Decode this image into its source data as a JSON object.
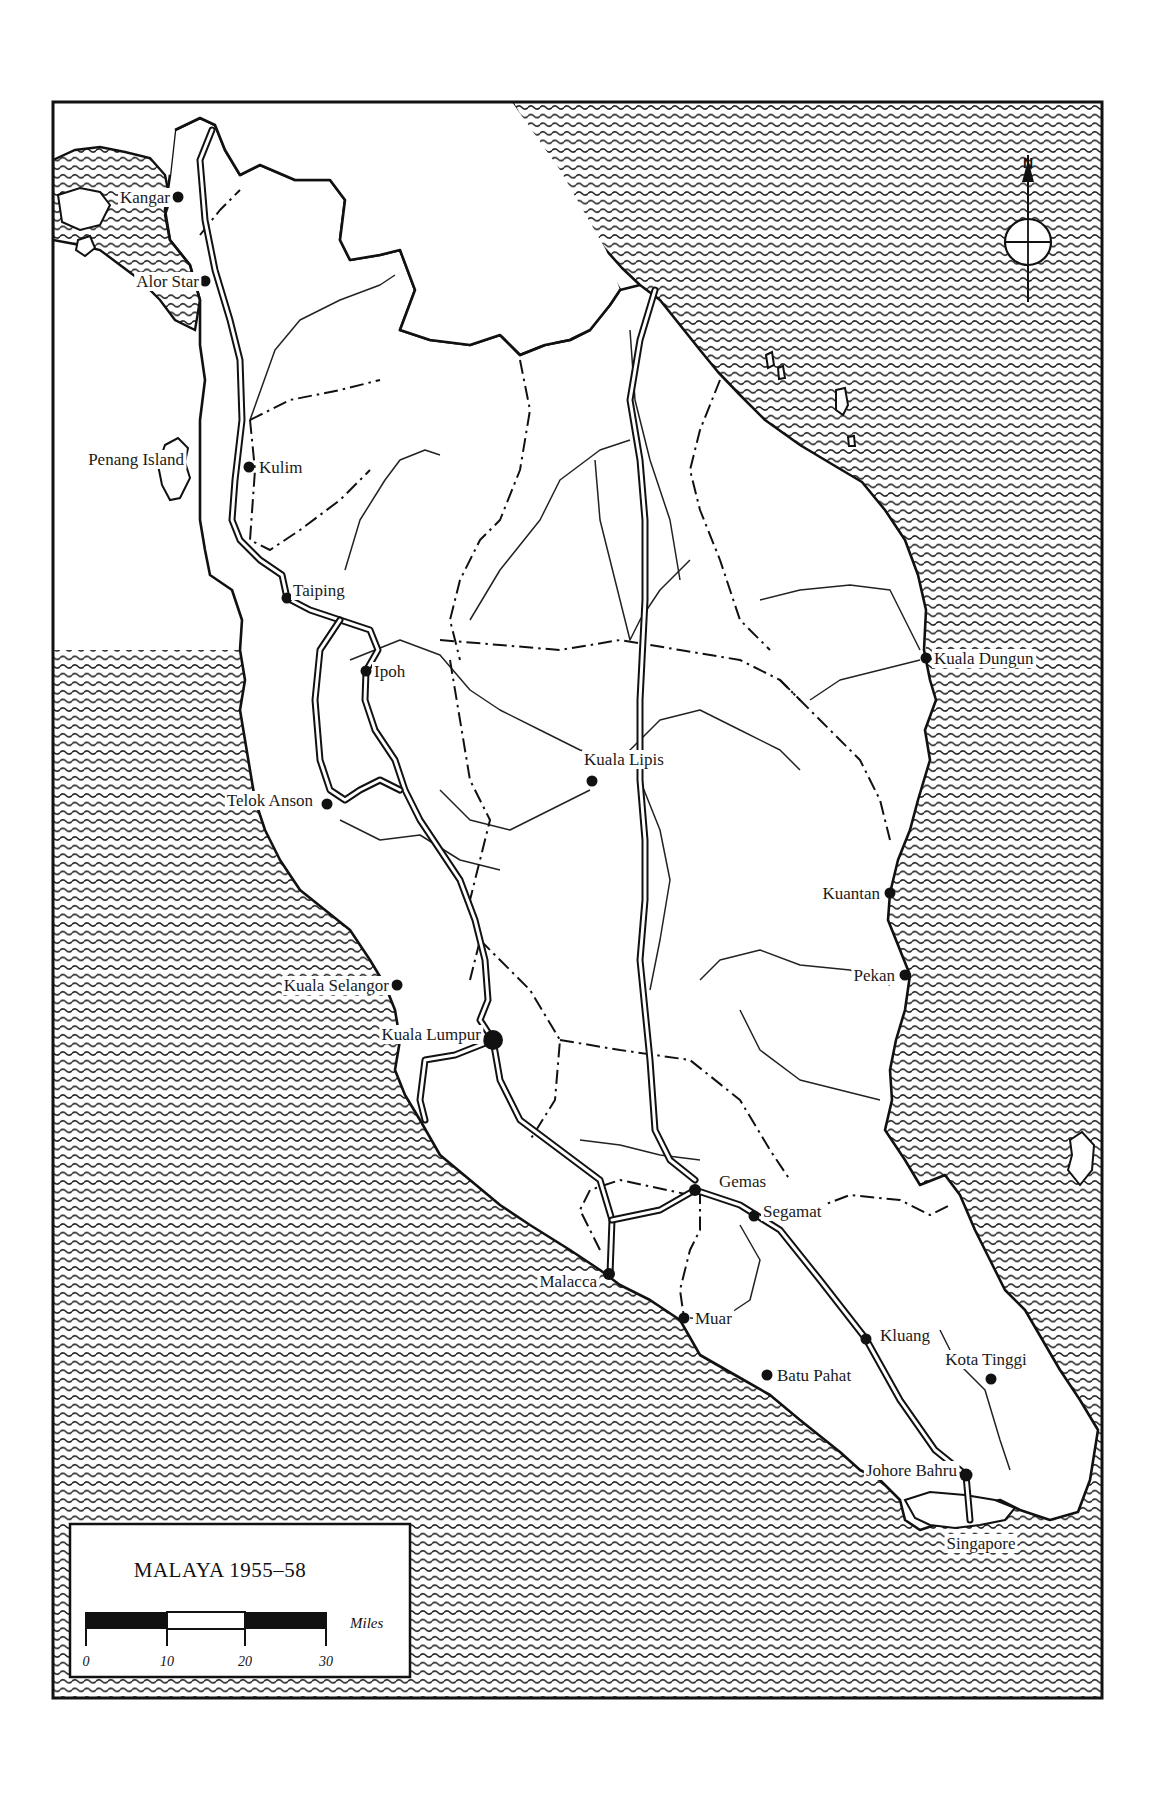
{
  "map": {
    "title": "MALAYA 1955–58",
    "frame": {
      "x": 53,
      "y": 102,
      "width": 1049,
      "height": 1596
    },
    "colors": {
      "ink": "#111111",
      "paper": "#ffffff",
      "sea_hatch": "#222222"
    },
    "north_arrow": {
      "label": "N",
      "x": 1028,
      "y": 238
    },
    "scale_bar": {
      "unit": "Miles",
      "ticks": [
        "0",
        "10",
        "20",
        "30"
      ],
      "segments": [
        "black",
        "white",
        "black"
      ]
    },
    "towns": [
      {
        "name": "Kangar",
        "x": 178,
        "y": 197,
        "anchor": "end",
        "dx": -8,
        "dy": 6,
        "size": 5.5
      },
      {
        "name": "Alor Star",
        "x": 205,
        "y": 281,
        "anchor": "end",
        "dx": -6,
        "dy": 6,
        "size": 5.5
      },
      {
        "name": "Penang Island",
        "x": 184,
        "y": 459,
        "anchor": "end",
        "dx": 0,
        "dy": 6,
        "size": 0
      },
      {
        "name": "Kulim",
        "x": 249,
        "y": 467,
        "anchor": "start",
        "dx": 10,
        "dy": 6,
        "size": 5.5
      },
      {
        "name": "Taiping",
        "x": 287,
        "y": 598,
        "anchor": "start",
        "dx": 6,
        "dy": -2,
        "size": 5.5
      },
      {
        "name": "Ipoh",
        "x": 366,
        "y": 671,
        "anchor": "start",
        "dx": 8,
        "dy": 6,
        "size": 5.5
      },
      {
        "name": "Telok Anson",
        "x": 327,
        "y": 804,
        "anchor": "end",
        "dx": -14,
        "dy": 2,
        "size": 5.5
      },
      {
        "name": "Kuala Lipis",
        "x": 592,
        "y": 781,
        "anchor": "middle",
        "dx": 32,
        "dy": -16,
        "size": 5.5
      },
      {
        "name": "Kuala Dungun",
        "x": 926,
        "y": 658,
        "anchor": "start",
        "dx": 8,
        "dy": 6,
        "size": 5.5
      },
      {
        "name": "Kuantan",
        "x": 890,
        "y": 893,
        "anchor": "end",
        "dx": -10,
        "dy": 6,
        "size": 5.5
      },
      {
        "name": "Pekan",
        "x": 905,
        "y": 975,
        "anchor": "end",
        "dx": -10,
        "dy": 6,
        "size": 5.5
      },
      {
        "name": "Kuala Selangor",
        "x": 397,
        "y": 985,
        "anchor": "end",
        "dx": -8,
        "dy": 6,
        "size": 5.5
      },
      {
        "name": "Kuala Lumpur",
        "x": 493,
        "y": 1040,
        "anchor": "end",
        "dx": -12,
        "dy": 0,
        "size": 10
      },
      {
        "name": "Gemas",
        "x": 695,
        "y": 1190,
        "anchor": "start",
        "dx": 24,
        "dy": -3,
        "size": 6
      },
      {
        "name": "Segamat",
        "x": 754,
        "y": 1216,
        "anchor": "start",
        "dx": 9,
        "dy": 1,
        "size": 5.5
      },
      {
        "name": "Malacca",
        "x": 609,
        "y": 1274,
        "anchor": "end",
        "dx": -12,
        "dy": 13,
        "size": 6
      },
      {
        "name": "Muar",
        "x": 684,
        "y": 1318,
        "anchor": "start",
        "dx": 11,
        "dy": 6,
        "size": 5.5
      },
      {
        "name": "Batu Pahat",
        "x": 767,
        "y": 1375,
        "anchor": "start",
        "dx": 10,
        "dy": 6,
        "size": 5.5
      },
      {
        "name": "Kluang",
        "x": 866,
        "y": 1339,
        "anchor": "start",
        "dx": 14,
        "dy": 2,
        "size": 5.5
      },
      {
        "name": "Kota Tinggi",
        "x": 991,
        "y": 1379,
        "anchor": "middle",
        "dx": -5,
        "dy": -14,
        "size": 5.5
      },
      {
        "name": "Johore Bahru",
        "x": 966,
        "y": 1475,
        "anchor": "end",
        "dx": -9,
        "dy": 1,
        "size": 6.5
      },
      {
        "name": "Singapore",
        "x": 981,
        "y": 1549,
        "anchor": "middle",
        "dx": 0,
        "dy": 0,
        "size": 0
      }
    ]
  },
  "legend": {
    "title": "MALAYA 1955–58",
    "unit_label": "Miles",
    "tick_0": "0",
    "tick_10": "10",
    "tick_20": "20",
    "tick_30": "30"
  }
}
